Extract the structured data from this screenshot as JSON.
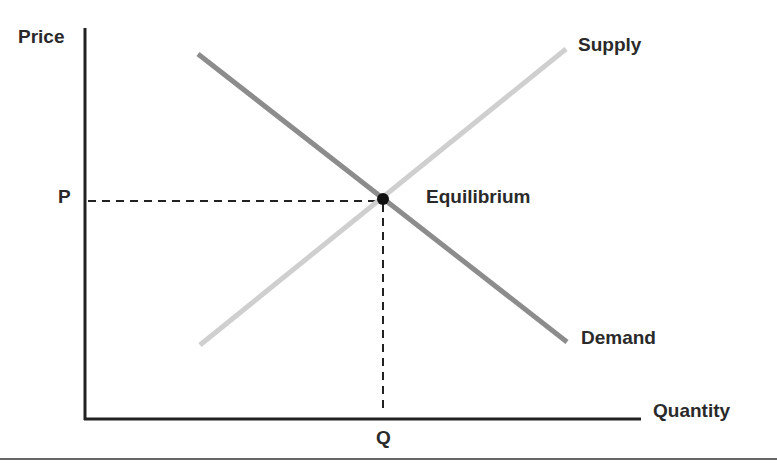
{
  "diagram": {
    "type": "supply-demand",
    "axes": {
      "y_label": "Price",
      "x_label": "Quantity"
    },
    "curves": [
      {
        "name": "Supply",
        "color": "#cfcfcf",
        "from": [
          200,
          345
        ],
        "to": [
          566,
          49
        ]
      },
      {
        "name": "Demand",
        "color": "#8c8c8c",
        "from": [
          198,
          54
        ],
        "to": [
          567,
          342
        ]
      }
    ],
    "equilibrium": {
      "label": "Equilibrium",
      "point": [
        383,
        199
      ],
      "price_label": "P",
      "quantity_label": "Q"
    }
  },
  "labels": {
    "price": "Price",
    "quantity": "Quantity",
    "supply": "Supply",
    "demand": "Demand",
    "equilibrium": "Equilibrium",
    "p": "P",
    "q": "Q"
  }
}
